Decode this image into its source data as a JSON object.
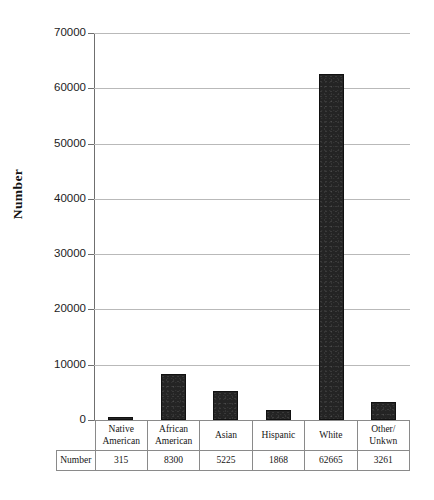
{
  "chart_data": {
    "type": "bar",
    "title": "",
    "subtitle": "",
    "xlabel": "",
    "ylabel": "Number",
    "ylim": [
      0,
      70000
    ],
    "ytick_step": 10000,
    "yticks": [
      "70000",
      "60000",
      "50000",
      "40000",
      "30000",
      "20000",
      "10000",
      "0"
    ],
    "ytick_values": [
      70000,
      60000,
      50000,
      40000,
      30000,
      20000,
      10000,
      0
    ],
    "grid": true,
    "legend": false,
    "bar_color": "#242424",
    "gridline_color": "#b9b9b9",
    "categories": [
      "Native American",
      "African American",
      "Asian",
      "Hispanic",
      "White",
      "Other/ Unkwn"
    ],
    "category_lines": [
      [
        "Native",
        "American"
      ],
      [
        "African",
        "American"
      ],
      [
        "Asian",
        ""
      ],
      [
        "Hispanic",
        ""
      ],
      [
        "White",
        ""
      ],
      [
        "Other/",
        "Unkwn"
      ]
    ],
    "values": [
      315,
      8300,
      5225,
      1868,
      62665,
      3261
    ],
    "value_labels": [
      "315",
      "8300",
      "5225",
      "1868",
      "62665",
      "3261"
    ]
  },
  "table": {
    "row_header": "Number",
    "header_row": [
      "Native American",
      "African American",
      "Asian",
      "Hispanic",
      "White",
      "Other/ Unkwn"
    ],
    "value_row": [
      "315",
      "8300",
      "5225",
      "1868",
      "62665",
      "3261"
    ]
  }
}
